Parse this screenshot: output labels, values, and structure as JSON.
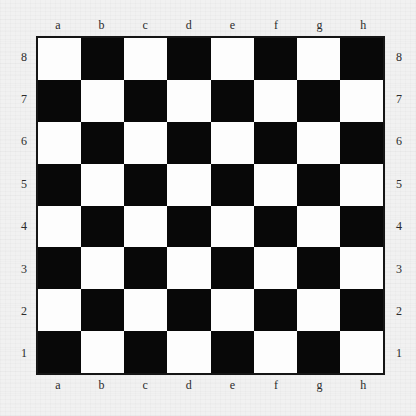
{
  "board": {
    "title": "Empty chessboard",
    "size": 8,
    "orientation": "white-bottom",
    "pieces": [],
    "colors": {
      "light_square": "#fdfdfd",
      "dark_square": "#080808",
      "border": "#151515",
      "background": "#f1f1f1",
      "label_text": "#2b2b2b"
    },
    "files": [
      "a",
      "b",
      "c",
      "d",
      "e",
      "f",
      "g",
      "h"
    ],
    "ranks": [
      "8",
      "7",
      "6",
      "5",
      "4",
      "3",
      "2",
      "1"
    ],
    "top_left_square_color": "light",
    "squares": [
      [
        "light",
        "dark",
        "light",
        "dark",
        "light",
        "dark",
        "light",
        "dark"
      ],
      [
        "dark",
        "light",
        "dark",
        "light",
        "dark",
        "light",
        "dark",
        "light"
      ],
      [
        "light",
        "dark",
        "light",
        "dark",
        "light",
        "dark",
        "light",
        "dark"
      ],
      [
        "dark",
        "light",
        "dark",
        "light",
        "dark",
        "light",
        "dark",
        "light"
      ],
      [
        "light",
        "dark",
        "light",
        "dark",
        "light",
        "dark",
        "light",
        "dark"
      ],
      [
        "dark",
        "light",
        "dark",
        "light",
        "dark",
        "light",
        "dark",
        "light"
      ],
      [
        "light",
        "dark",
        "light",
        "dark",
        "light",
        "dark",
        "light",
        "dark"
      ],
      [
        "dark",
        "light",
        "dark",
        "light",
        "dark",
        "light",
        "dark",
        "light"
      ]
    ]
  }
}
